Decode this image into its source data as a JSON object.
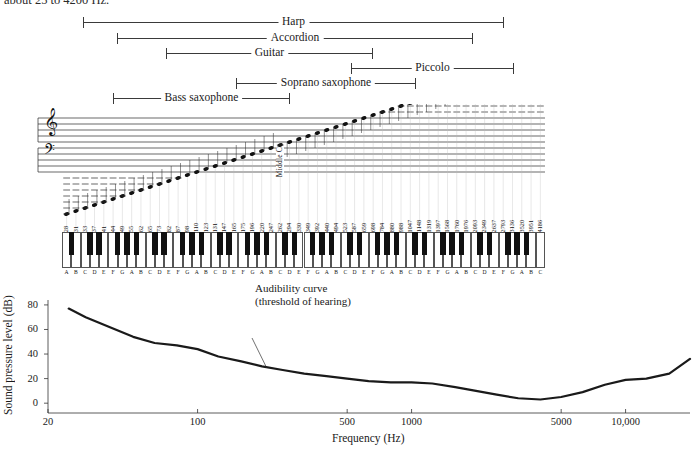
{
  "caption": {
    "text": "about 25 to 4200 Hz."
  },
  "instrument_ranges": [
    {
      "name": "Harp",
      "label": "Harp",
      "low_hz": 31,
      "high_hz": 3136,
      "x1": 83,
      "x2": 504,
      "y": 16
    },
    {
      "name": "Accordion",
      "label": "Accordion",
      "low_hz": 44,
      "high_hz": 2093,
      "x1": 117,
      "x2": 473,
      "y": 32
    },
    {
      "name": "Guitar",
      "label": "Guitar",
      "low_hz": 82,
      "high_hz": 880,
      "x1": 166,
      "x2": 373,
      "y": 47
    },
    {
      "name": "Piccolo",
      "label": "Piccolo",
      "low_hz": 587,
      "high_hz": 3951,
      "x1": 351,
      "x2": 514,
      "y": 62
    },
    {
      "name": "Soprano saxophone",
      "label": "Soprano saxophone",
      "low_hz": 207,
      "high_hz": 1397,
      "x1": 236,
      "x2": 416,
      "y": 77
    },
    {
      "name": "Bass saxophone",
      "label": "Bass saxophone",
      "low_hz": 55,
      "high_hz": 523,
      "x1": 113,
      "x2": 290,
      "y": 92
    }
  ],
  "staff": {
    "middle_c_label": "Middle C",
    "middle_c_key_index": 39,
    "clefs": [
      "treble-clef",
      "bass-clef"
    ]
  },
  "keyboard": {
    "key_count": 88,
    "white_key_count": 52,
    "note_letters": [
      "A",
      "B",
      "C",
      "D",
      "E",
      "F",
      "G",
      "A",
      "B",
      "C",
      "D",
      "E",
      "F",
      "G",
      "A",
      "B",
      "C",
      "D",
      "E",
      "F",
      "G",
      "A",
      "B",
      "C",
      "D",
      "E",
      "F",
      "G",
      "A",
      "B",
      "C",
      "D",
      "E",
      "F",
      "G",
      "A",
      "B",
      "C",
      "D",
      "E",
      "F",
      "G",
      "A",
      "B",
      "C",
      "D",
      "E",
      "F",
      "G",
      "A",
      "B",
      "C"
    ],
    "frequencies_hz": [
      28,
      31,
      33,
      37,
      41,
      44,
      49,
      55,
      62,
      65,
      73,
      82,
      87,
      98,
      110,
      123,
      131,
      147,
      165,
      175,
      196,
      220,
      247,
      262,
      294,
      330,
      349,
      392,
      440,
      494,
      523,
      587,
      659,
      698,
      784,
      880,
      988,
      1047,
      1148,
      1319,
      1397,
      1568,
      1760,
      1976,
      2093,
      2349,
      2637,
      2793,
      3136,
      3520,
      3951,
      4186
    ]
  },
  "chart_data": {
    "type": "line",
    "title": "",
    "xlabel": "Frequency (Hz)",
    "ylabel": "Sound pressure level (dB)",
    "xscale": "log",
    "xlim": [
      20,
      20000
    ],
    "ylim": [
      -8,
      84
    ],
    "grid": false,
    "legend": "none",
    "annotations": [
      {
        "name": "audibility-curve-annotation",
        "line1": "Audibility curve",
        "line2": "(threshold of hearing)",
        "x": 255,
        "y": 330
      }
    ],
    "xticks": [
      20,
      100,
      500,
      1000,
      5000,
      10000
    ],
    "xtick_labels": [
      "20",
      "100",
      "500",
      "1000",
      "5000",
      "10,000"
    ],
    "yticks": [
      0,
      20,
      40,
      60,
      80
    ],
    "ytick_labels": [
      "0",
      "20",
      "40",
      "60",
      "80"
    ],
    "series": [
      {
        "name": "Audibility curve (threshold of hearing)",
        "x": [
          25,
          30,
          40,
          50,
          63,
          80,
          100,
          125,
          160,
          200,
          250,
          315,
          400,
          500,
          630,
          800,
          1000,
          1250,
          1600,
          2000,
          2500,
          3150,
          4000,
          5000,
          6300,
          8000,
          10000,
          12500,
          16000,
          20000
        ],
        "y": [
          77,
          70,
          61,
          54,
          49,
          47,
          44,
          38,
          34,
          30,
          27,
          24,
          22,
          20,
          18,
          17,
          17,
          16,
          13,
          10,
          7,
          4,
          3,
          5,
          9,
          15,
          19,
          20,
          24,
          36
        ]
      }
    ]
  }
}
